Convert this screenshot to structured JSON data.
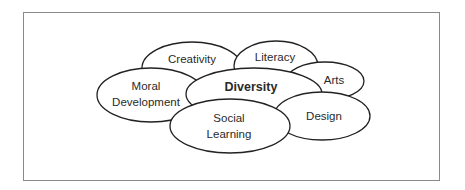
{
  "diagram": {
    "type": "overlapping-ellipses",
    "center_concept": "Diversity",
    "nodes": [
      {
        "id": "creativity",
        "label": "Creativity",
        "lines": [
          "Creativity"
        ],
        "cx": 192,
        "cy": 68,
        "rx": 50,
        "ry": 26,
        "bold": false
      },
      {
        "id": "literacy",
        "label": "Literacy",
        "lines": [
          "Literacy"
        ],
        "cx": 276,
        "cy": 66,
        "rx": 42,
        "ry": 25,
        "bold": false
      },
      {
        "id": "arts",
        "label": "Arts",
        "lines": [
          "Arts"
        ],
        "cx": 325,
        "cy": 81,
        "rx": 39,
        "ry": 19,
        "bold": false
      },
      {
        "id": "moral-development",
        "label": "Moral Development",
        "lines": [
          "Moral",
          "Development"
        ],
        "cx": 151,
        "cy": 95,
        "rx": 54,
        "ry": 27,
        "bold": false
      },
      {
        "id": "diversity",
        "label": "Diversity",
        "lines": [
          "Diversity"
        ],
        "cx": 254,
        "cy": 94,
        "rx": 68,
        "ry": 26,
        "bold": true
      },
      {
        "id": "design",
        "label": "Design",
        "lines": [
          "Design"
        ],
        "cx": 322,
        "cy": 116,
        "rx": 48,
        "ry": 24,
        "bold": false
      },
      {
        "id": "social-learning",
        "label": "Social Learning",
        "lines": [
          "Social",
          "Learning"
        ],
        "cx": 230,
        "cy": 126,
        "rx": 60,
        "ry": 27,
        "bold": false
      }
    ],
    "labels": {
      "creativity": "Creativity",
      "literacy": "Literacy",
      "arts": "Arts",
      "moral_line1": "Moral",
      "moral_line2": "Development",
      "diversity": "Diversity",
      "design": "Design",
      "social_line1": "Social",
      "social_line2": "Learning"
    }
  }
}
